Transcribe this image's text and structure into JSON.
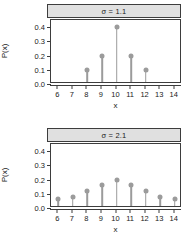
{
  "figure": {
    "axis_title_x": "x",
    "axis_title_y": "P(x)"
  },
  "panels": [
    {
      "strip": "σ = 1.1"
    },
    {
      "strip": "σ = 2.1"
    }
  ],
  "axes": {
    "x_ticks": [
      "6",
      "7",
      "8",
      "9",
      "10",
      "11",
      "12",
      "13",
      "14"
    ],
    "y_ticks": [
      "0.0",
      "0.1",
      "0.2",
      "0.3",
      "0.4"
    ]
  },
  "colors": {
    "stem": "#9b9b9b",
    "axis": "#3d3d3d",
    "strip_fill": "#e0e0e0",
    "background": "#ffffff"
  },
  "chart_data": [
    {
      "type": "line",
      "title": "σ = 1.1",
      "xlabel": "x",
      "ylabel": "P(x)",
      "xlim": [
        5.5,
        14.5
      ],
      "ylim": [
        0.0,
        0.45
      ],
      "grid": false,
      "legend": "none",
      "style": "stem",
      "x": [
        6,
        7,
        8,
        9,
        10,
        11,
        12,
        13,
        14
      ],
      "values": [
        0.0,
        0.0,
        0.1,
        0.2,
        0.4,
        0.2,
        0.1,
        0.0,
        0.0
      ],
      "xtick_labels": [
        "6",
        "7",
        "8",
        "9",
        "10",
        "11",
        "12",
        "13",
        "14"
      ],
      "ytick_labels": [
        "0.0",
        "0.1",
        "0.2",
        "0.3",
        "0.4"
      ]
    },
    {
      "type": "line",
      "title": "σ = 2.1",
      "xlabel": "x",
      "ylabel": "P(x)",
      "xlim": [
        5.5,
        14.5
      ],
      "ylim": [
        0.0,
        0.45
      ],
      "grid": false,
      "legend": "none",
      "style": "stem",
      "x": [
        6,
        7,
        8,
        9,
        10,
        11,
        12,
        13,
        14
      ],
      "values": [
        0.06,
        0.08,
        0.12,
        0.16,
        0.2,
        0.16,
        0.12,
        0.08,
        0.06
      ],
      "xtick_labels": [
        "6",
        "7",
        "8",
        "9",
        "10",
        "11",
        "12",
        "13",
        "14"
      ],
      "ytick_labels": [
        "0.0",
        "0.1",
        "0.2",
        "0.3",
        "0.4"
      ]
    }
  ]
}
